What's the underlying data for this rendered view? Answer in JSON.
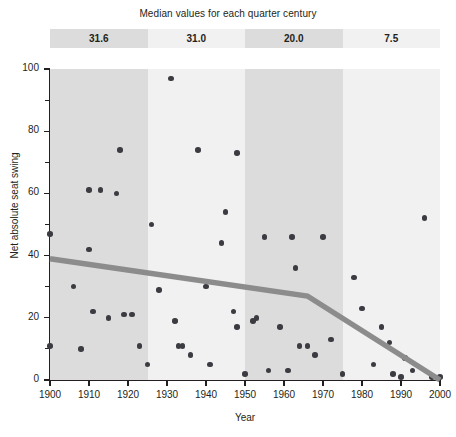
{
  "header": {
    "title": "Median values for each quarter century",
    "bands": [
      {
        "label": "31.6",
        "start_year": 1900,
        "end_year": 1925
      },
      {
        "label": "31.0",
        "start_year": 1925,
        "end_year": 1950
      },
      {
        "label": "20.0",
        "start_year": 1950,
        "end_year": 1975
      },
      {
        "label": "7.5",
        "start_year": 1975,
        "end_year": 2000
      }
    ]
  },
  "colors": {
    "band_dark": "#dcdcdc",
    "band_light": "#f1f1f1",
    "dot": "#3b3b42",
    "trend_line": "#8c8c8c",
    "axis": "#231f20",
    "background": "#ffffff"
  },
  "chart_data": {
    "type": "scatter",
    "title": "Median values for each quarter century",
    "xlabel": "Year",
    "ylabel": "Net absolute seat swing",
    "xlim": [
      1900,
      2000
    ],
    "ylim": [
      0,
      100
    ],
    "grid": false,
    "legend": "none",
    "xticks": [
      1900,
      1910,
      1920,
      1930,
      1940,
      1950,
      1960,
      1970,
      1980,
      1990,
      2000
    ],
    "yticks": [
      0,
      20,
      40,
      60,
      80,
      100
    ],
    "yticks_minor": [
      10,
      30,
      50,
      70,
      90
    ],
    "points": [
      {
        "x": 1900,
        "y": 11
      },
      {
        "x": 1900,
        "y": 47
      },
      {
        "x": 1906,
        "y": 30
      },
      {
        "x": 1908,
        "y": 10
      },
      {
        "x": 1910,
        "y": 61
      },
      {
        "x": 1910,
        "y": 42
      },
      {
        "x": 1911,
        "y": 22
      },
      {
        "x": 1913,
        "y": 61
      },
      {
        "x": 1915,
        "y": 20
      },
      {
        "x": 1917,
        "y": 60
      },
      {
        "x": 1918,
        "y": 74
      },
      {
        "x": 1919,
        "y": 21
      },
      {
        "x": 1921,
        "y": 21
      },
      {
        "x": 1923,
        "y": 11
      },
      {
        "x": 1925,
        "y": 5
      },
      {
        "x": 1926,
        "y": 50
      },
      {
        "x": 1928,
        "y": 29
      },
      {
        "x": 1931,
        "y": 97
      },
      {
        "x": 1932,
        "y": 19
      },
      {
        "x": 1933,
        "y": 11
      },
      {
        "x": 1934,
        "y": 11
      },
      {
        "x": 1936,
        "y": 8
      },
      {
        "x": 1938,
        "y": 74
      },
      {
        "x": 1940,
        "y": 30
      },
      {
        "x": 1941,
        "y": 5
      },
      {
        "x": 1944,
        "y": 44
      },
      {
        "x": 1945,
        "y": 54
      },
      {
        "x": 1947,
        "y": 22
      },
      {
        "x": 1948,
        "y": 17
      },
      {
        "x": 1948,
        "y": 73
      },
      {
        "x": 1950,
        "y": 2
      },
      {
        "x": 1952,
        "y": 19
      },
      {
        "x": 1953,
        "y": 20
      },
      {
        "x": 1955,
        "y": 46
      },
      {
        "x": 1956,
        "y": 3
      },
      {
        "x": 1959,
        "y": 17
      },
      {
        "x": 1961,
        "y": 3
      },
      {
        "x": 1962,
        "y": 46
      },
      {
        "x": 1963,
        "y": 36
      },
      {
        "x": 1964,
        "y": 11
      },
      {
        "x": 1966,
        "y": 11
      },
      {
        "x": 1968,
        "y": 8
      },
      {
        "x": 1970,
        "y": 46
      },
      {
        "x": 1972,
        "y": 13
      },
      {
        "x": 1975,
        "y": 2
      },
      {
        "x": 1978,
        "y": 33
      },
      {
        "x": 1980,
        "y": 23
      },
      {
        "x": 1983,
        "y": 5
      },
      {
        "x": 1985,
        "y": 17
      },
      {
        "x": 1987,
        "y": 12
      },
      {
        "x": 1988,
        "y": 2
      },
      {
        "x": 1990,
        "y": 1
      },
      {
        "x": 1991,
        "y": 7
      },
      {
        "x": 1993,
        "y": 3
      },
      {
        "x": 1996,
        "y": 52
      },
      {
        "x": 1998,
        "y": 1
      },
      {
        "x": 2000,
        "y": 1
      }
    ],
    "trend_line": {
      "label": "piecewise trend",
      "vertices": [
        {
          "x": 1900,
          "y": 39
        },
        {
          "x": 1966,
          "y": 27
        },
        {
          "x": 2000,
          "y": 0
        }
      ]
    }
  }
}
